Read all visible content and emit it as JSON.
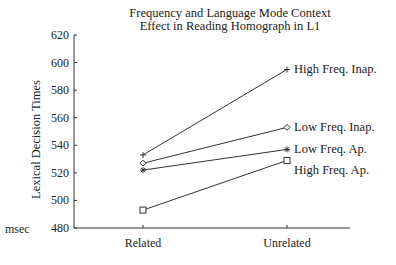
{
  "chart_data": {
    "type": "line",
    "title": "Frequency and Language Mode Context",
    "subtitle": "Effect in Reading Homograph in L1",
    "xlabel": "",
    "ylabel": "Lexical Decision Times",
    "yunit": "msec",
    "categories": [
      "Related",
      "Unrelated"
    ],
    "ylim": [
      480,
      620
    ],
    "yticks": [
      480,
      500,
      520,
      540,
      560,
      580,
      600,
      620
    ],
    "grid": false,
    "legend_position": "inline-right",
    "series": [
      {
        "name": "High Freq. Inap.",
        "marker": "plus",
        "values": [
          533,
          595
        ]
      },
      {
        "name": "Low Freq. Inap.",
        "marker": "diamond",
        "values": [
          527,
          553
        ]
      },
      {
        "name": "Low Freq. Ap.",
        "marker": "asterisk",
        "values": [
          522,
          537
        ]
      },
      {
        "name": "High Freq. Ap.",
        "marker": "square",
        "values": [
          493,
          529
        ]
      }
    ]
  }
}
